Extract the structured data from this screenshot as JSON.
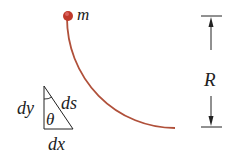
{
  "diagram": {
    "mass_label": "m",
    "radius_label": "R",
    "triangle": {
      "vertical_label": "dy",
      "hypotenuse_label": "ds",
      "horizontal_label": "dx",
      "angle_label": "θ"
    },
    "colors": {
      "track": "#b0503a",
      "mass": "#c0392b",
      "ink": "#222222"
    }
  }
}
